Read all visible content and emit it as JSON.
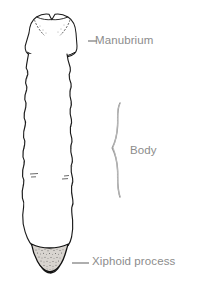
{
  "figure": {
    "background_color": "#ffffff",
    "bone_outline_color": "#1a1a1a",
    "bone_fill_color": "#ffffff",
    "label_color": "#8c8c8c",
    "leader_color": "#8c8c8c",
    "brace_color": "#8c8c8c"
  },
  "labels": {
    "manubrium": "Manubrium",
    "body": "Body",
    "xiphoid": "Xiphoid process"
  },
  "parts": {
    "manubrium": "manubrium-region",
    "body": "body-region",
    "xiphoid": "xiphoid-process-region"
  },
  "leaders": {
    "manubrium_dash": "short-dash-leader",
    "xiphoid_dash": "long-dash-leader",
    "body_brace": "curly-brace"
  }
}
